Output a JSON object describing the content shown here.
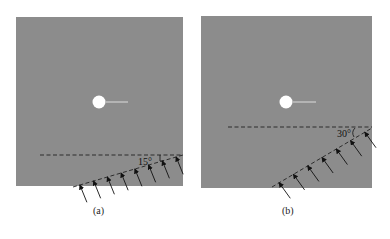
{
  "figure": {
    "panels": [
      {
        "id": "a",
        "caption": "(a)",
        "angle_label": "15°",
        "angle_deg": 15,
        "arrow_count": 8,
        "plate_color": "#8c8c8c",
        "hole_color": "#ffffff"
      },
      {
        "id": "b",
        "caption": "(b)",
        "angle_label": "30°",
        "angle_deg": 30,
        "arrow_count": 7,
        "plate_color": "#8c8c8c",
        "hole_color": "#ffffff"
      }
    ]
  }
}
